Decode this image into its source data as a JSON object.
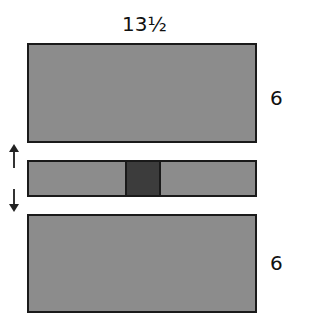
{
  "diagram": {
    "top_width_label": "13½",
    "top_height_label": "6",
    "bottom_height_label": "6",
    "colors": {
      "panel": "#8c8c8c",
      "accent_block": "#3c3c3c",
      "border": "#1a1a1a"
    },
    "arrows": [
      "up-arrow",
      "down-arrow"
    ]
  }
}
